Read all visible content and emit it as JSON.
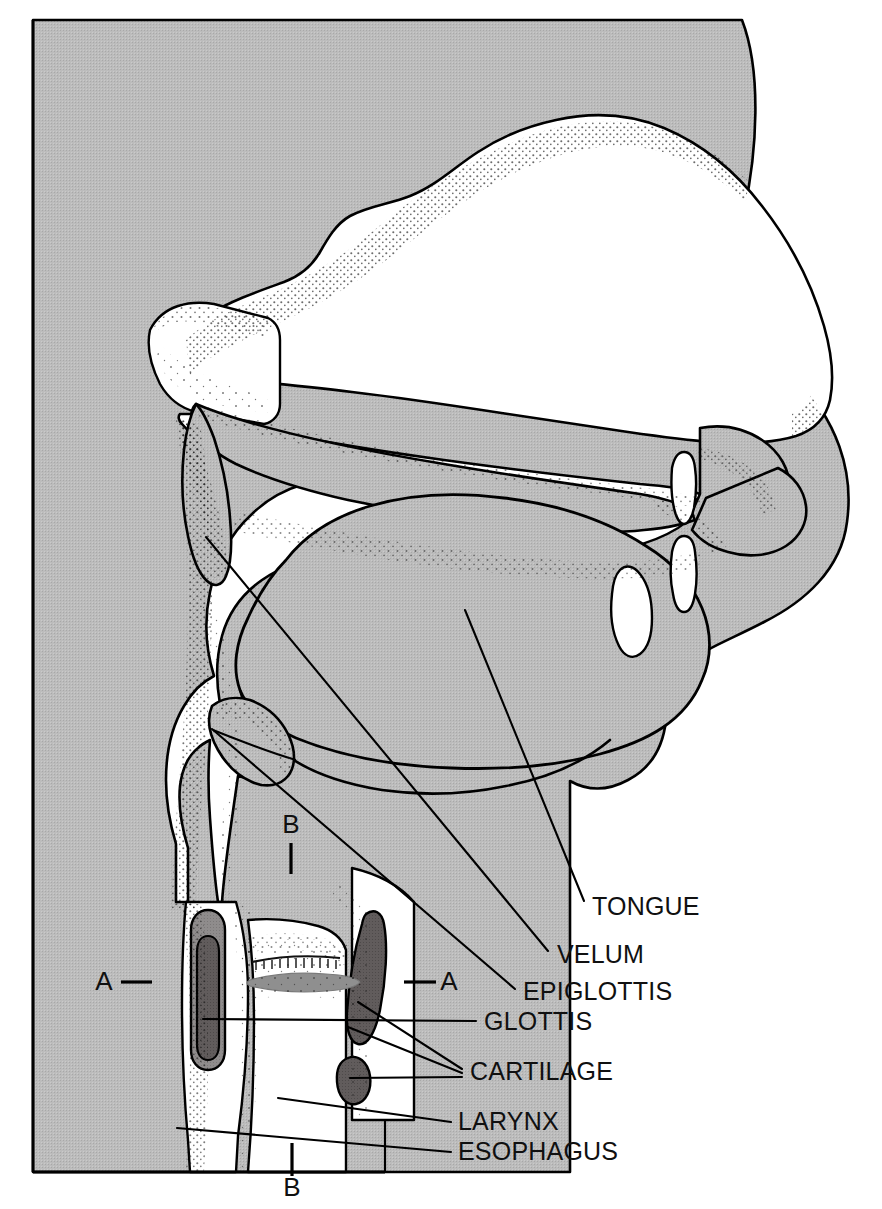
{
  "figure": {
    "width": 882,
    "height": 1209
  },
  "colors": {
    "tissue_gray": "#b9b9b9",
    "cavity_white": "#ffffff",
    "cartilage_dark": "#5f5a5a",
    "cartilage_mid": "#8d8a8a",
    "glottis_gray": "#8a8a8a",
    "outline_black": "#000000",
    "stipple_black": "#1a1a1a",
    "page_background": "#ffffff"
  },
  "labels": [
    {
      "id": "tongue",
      "text": "TONGUE",
      "x": 592,
      "y": 915,
      "anchor": "start"
    },
    {
      "id": "velum",
      "text": "VELUM",
      "x": 557,
      "y": 963,
      "anchor": "start"
    },
    {
      "id": "epiglottis",
      "text": "EPIGLOTTIS",
      "x": 523,
      "y": 1000,
      "anchor": "start"
    },
    {
      "id": "glottis",
      "text": "GLOTTIS",
      "x": 484,
      "y": 1030,
      "anchor": "start"
    },
    {
      "id": "cartilage",
      "text": "CARTILAGE",
      "x": 470,
      "y": 1080,
      "anchor": "start"
    },
    {
      "id": "larynx",
      "text": "LARYNX",
      "x": 458,
      "y": 1130,
      "anchor": "start"
    },
    {
      "id": "esophagus",
      "text": "ESOPHAGUS",
      "x": 458,
      "y": 1160,
      "anchor": "start"
    }
  ],
  "section_markers": [
    {
      "id": "a-left",
      "text": "A",
      "x": 104,
      "y": 990,
      "anchor": "middle"
    },
    {
      "id": "a-right",
      "text": "A",
      "x": 449,
      "y": 990,
      "anchor": "middle"
    },
    {
      "id": "b-top",
      "text": "B",
      "x": 291,
      "y": 833,
      "anchor": "middle"
    },
    {
      "id": "b-bottom",
      "text": "B",
      "x": 292,
      "y": 1196,
      "anchor": "middle"
    }
  ],
  "section_ticks": [
    {
      "id": "a-left-dash",
      "x1": 121,
      "y1": 982,
      "x2": 152,
      "y2": 982
    },
    {
      "id": "a-right-dash",
      "x1": 404,
      "y1": 982,
      "x2": 436,
      "y2": 982
    },
    {
      "id": "b-top-bar",
      "x1": 291,
      "y1": 843,
      "x2": 291,
      "y2": 874
    },
    {
      "id": "b-bottom-bar",
      "x1": 292,
      "y1": 1143,
      "x2": 292,
      "y2": 1176
    }
  ],
  "leaders": [
    {
      "id": "tongue-leader",
      "points": "465,610 584,901"
    },
    {
      "id": "velum-leader",
      "points": "206,537 548,951"
    },
    {
      "id": "epiglottis-leader",
      "points": "212,729 515,989"
    },
    {
      "id": "glottis-leader",
      "points": "203,1019 476,1021"
    },
    {
      "id": "cartilage-leader-1",
      "points": "358,1002 462,1069"
    },
    {
      "id": "cartilage-leader-2",
      "points": "348,1027 462,1073"
    },
    {
      "id": "cartilage-leader-3",
      "points": "350,1078 462,1077"
    },
    {
      "id": "larynx-leader",
      "points": "278,1098 451,1122"
    },
    {
      "id": "esophagus-leader",
      "points": "177,1128 451,1152"
    }
  ],
  "structures": [
    {
      "id": "nasal-cavity",
      "name": "nasal cavity"
    },
    {
      "id": "hard-palate",
      "name": "hard palate"
    },
    {
      "id": "velum",
      "name": "velum / soft palate"
    },
    {
      "id": "tongue",
      "name": "tongue"
    },
    {
      "id": "lips",
      "name": "lips"
    },
    {
      "id": "teeth",
      "name": "teeth"
    },
    {
      "id": "pharynx",
      "name": "pharynx"
    },
    {
      "id": "epiglottis",
      "name": "epiglottis"
    },
    {
      "id": "glottis",
      "name": "glottis"
    },
    {
      "id": "cartilage-left",
      "name": "left cartilage"
    },
    {
      "id": "cartilage-right-upper",
      "name": "thyroid cartilage"
    },
    {
      "id": "cartilage-right-lower",
      "name": "cricoid cartilage"
    },
    {
      "id": "larynx",
      "name": "larynx"
    },
    {
      "id": "esophagus",
      "name": "esophagus"
    },
    {
      "id": "trachea",
      "name": "trachea"
    }
  ]
}
